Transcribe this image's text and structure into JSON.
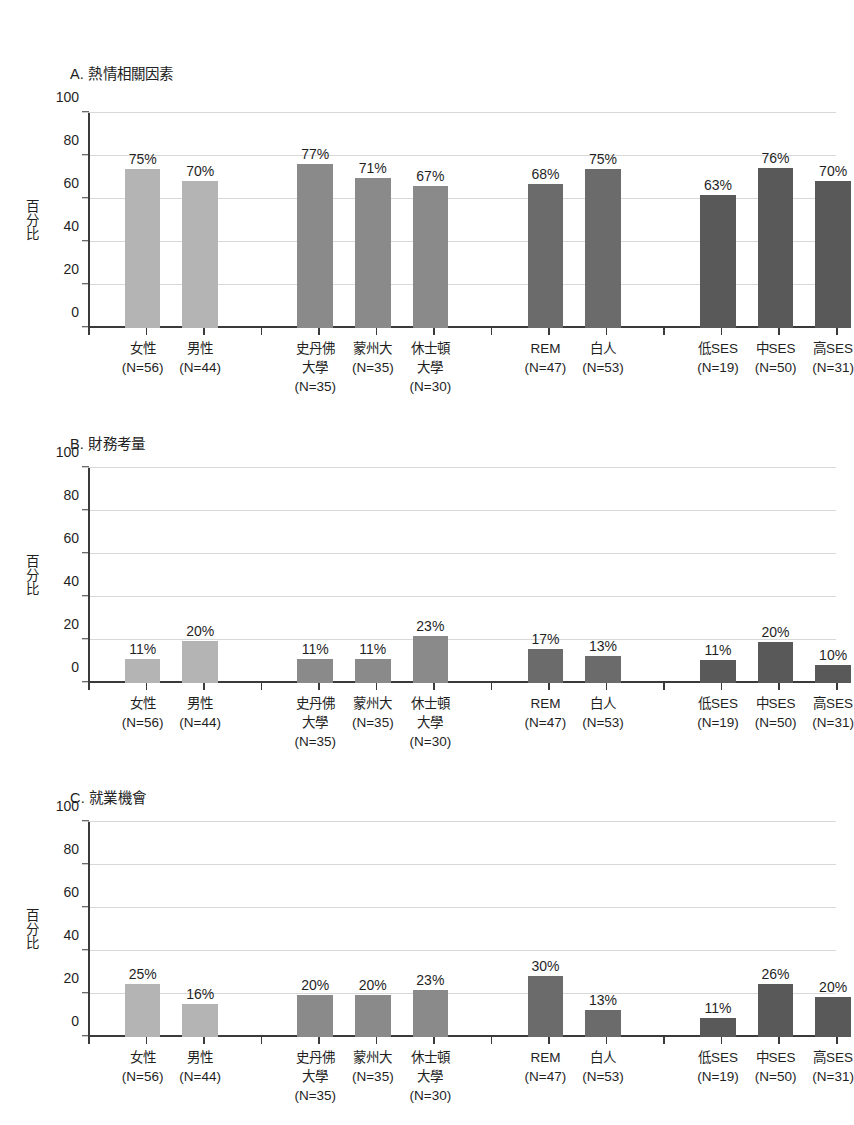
{
  "figure": {
    "axis": {
      "y_ticks": [
        "0",
        "20",
        "40",
        "60",
        "80",
        "100"
      ],
      "y_axis_title": "百分比",
      "y_axis_title_chars": [
        "百",
        "分",
        "比"
      ],
      "ylim": [
        0,
        100
      ]
    },
    "categories": [
      {
        "name": "女性",
        "lines": [
          "女性",
          "(N=56)"
        ],
        "n": 56,
        "group": 1
      },
      {
        "name": "男性",
        "lines": [
          "男性",
          "(N=44)"
        ],
        "n": 44,
        "group": 1
      },
      {
        "name": "史丹佛大學",
        "lines": [
          "史丹佛",
          "大學",
          "(N=35)"
        ],
        "n": 35,
        "group": 2
      },
      {
        "name": "蒙州大",
        "lines": [
          "蒙州大",
          "(N=35)"
        ],
        "n": 35,
        "group": 2
      },
      {
        "name": "休士頓大學",
        "lines": [
          "休士頓",
          "大學",
          "(N=30)"
        ],
        "n": 30,
        "group": 2
      },
      {
        "name": "REM",
        "lines": [
          "REM",
          "(N=47)"
        ],
        "n": 47,
        "group": 3
      },
      {
        "name": "白人",
        "lines": [
          "白人",
          "(N=53)"
        ],
        "n": 53,
        "group": 3
      },
      {
        "name": "低SES",
        "lines": [
          "低SES",
          "(N=19)"
        ],
        "n": 19,
        "group": 4
      },
      {
        "name": "中SES",
        "lines": [
          "中SES",
          "(N=50)"
        ],
        "n": 50,
        "group": 4
      },
      {
        "name": "高SES",
        "lines": [
          "高SES",
          "(N=31)"
        ],
        "n": 31,
        "group": 4
      }
    ]
  },
  "chart_data": [
    {
      "type": "bar",
      "panel": "A",
      "title": "A. 熱情相關因素",
      "xlabel": "",
      "ylabel": "百分比",
      "ylim": [
        0,
        100
      ],
      "yticks": [
        0,
        20,
        40,
        60,
        80,
        100
      ],
      "grid": true,
      "legend": "none",
      "categories": [
        "女性",
        "男性",
        "史丹佛大學",
        "蒙州大",
        "休士頓大學",
        "REM",
        "白人",
        "低SES",
        "中SES",
        "高SES"
      ],
      "values": [
        75,
        70,
        77,
        71,
        67,
        68,
        75,
        63,
        76,
        70
      ],
      "bar_heights": [
        74,
        68.5,
        76.5,
        70,
        66,
        67,
        74,
        62,
        74.5,
        68.5
      ],
      "value_labels": [
        "75%",
        "70%",
        "77%",
        "71%",
        "67%",
        "68%",
        "75%",
        "63%",
        "76%",
        "70%"
      ]
    },
    {
      "type": "bar",
      "panel": "B",
      "title": "B. 財務考量",
      "xlabel": "",
      "ylabel": "百分比",
      "ylim": [
        0,
        100
      ],
      "yticks": [
        0,
        20,
        40,
        60,
        80,
        100
      ],
      "grid": true,
      "legend": "none",
      "categories": [
        "女性",
        "男性",
        "史丹佛大學",
        "蒙州大",
        "休士頓大學",
        "REM",
        "白人",
        "低SES",
        "中SES",
        "高SES"
      ],
      "values": [
        11,
        20,
        11,
        11,
        23,
        17,
        13,
        11,
        20,
        10
      ],
      "bar_heights": [
        11,
        19.5,
        11,
        11,
        22,
        16,
        12.5,
        10.5,
        19,
        8.5
      ],
      "value_labels": [
        "11%",
        "20%",
        "11%",
        "11%",
        "23%",
        "17%",
        "13%",
        "11%",
        "20%",
        "10%"
      ]
    },
    {
      "type": "bar",
      "panel": "C",
      "title": "C. 就業機會",
      "xlabel": "",
      "ylabel": "百分比",
      "ylim": [
        0,
        100
      ],
      "yticks": [
        0,
        20,
        40,
        60,
        80,
        100
      ],
      "grid": true,
      "legend": "none",
      "categories": [
        "女性",
        "男性",
        "史丹佛大學",
        "蒙州大",
        "休士頓大學",
        "REM",
        "白人",
        "低SES",
        "中SES",
        "高SES"
      ],
      "values": [
        25,
        16,
        20,
        20,
        23,
        30,
        13,
        11,
        26,
        20
      ],
      "bar_heights": [
        24.5,
        15.5,
        19.5,
        19.5,
        22,
        28.5,
        12.5,
        9,
        24.5,
        18.5
      ],
      "value_labels": [
        "25%",
        "16%",
        "20%",
        "20%",
        "23%",
        "30%",
        "13%",
        "11%",
        "26%",
        "20%"
      ]
    }
  ],
  "colors": {
    "tone_light": "#b4b4b4",
    "tone_mid": "#8a8a8a",
    "tone_dark": "#6b6b6b",
    "tone_darker": "#595959",
    "axis": "#3a3a3a",
    "grid": "#d8d8d8",
    "text": "#1f1f1f"
  }
}
